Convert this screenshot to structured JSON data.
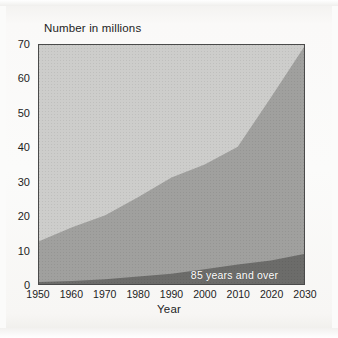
{
  "chart_data": {
    "type": "area",
    "title": "Number in millions",
    "xlabel": "Year",
    "ylabel": "Number in millions",
    "x": [
      1950,
      1960,
      1970,
      1980,
      1990,
      2000,
      2010,
      2020,
      2030
    ],
    "xtick_labels": [
      "1950",
      "1960",
      "1970",
      "1980",
      "1990",
      "2000",
      "2010",
      "2020",
      "2030"
    ],
    "ytick_labels": [
      "0",
      "10",
      "20",
      "30",
      "40",
      "50",
      "60",
      "70"
    ],
    "yticks": [
      0,
      10,
      20,
      30,
      40,
      50,
      60,
      70
    ],
    "xlim": [
      1950,
      2030
    ],
    "ylim": [
      0,
      70
    ],
    "grid": false,
    "legend_position": "inline-annotation",
    "annotations": [
      {
        "text": "85 years and over",
        "x": 2022,
        "y": 3,
        "color": "#ffffff"
      }
    ],
    "series": [
      {
        "name": "65 years and over",
        "values": [
          12.5,
          16.6,
          20.1,
          25.5,
          31.2,
          35.0,
          40.2,
          54.6,
          69.4
        ],
        "color": "#a0a09e",
        "stacked": true
      },
      {
        "name": "85 years and over",
        "values": [
          0.6,
          0.9,
          1.4,
          2.2,
          3.0,
          4.3,
          5.7,
          6.9,
          8.8
        ],
        "color": "#6c6c6a",
        "stacked": true
      }
    ],
    "colors": {
      "background": "#cdcdcb",
      "band_65_over": "#a0a09e",
      "band_85_over": "#6c6c6a",
      "axis": "#4a4a4a",
      "text": "#1d1d1d",
      "annotation_text": "#ffffff",
      "page": "#fbfbfa"
    }
  }
}
